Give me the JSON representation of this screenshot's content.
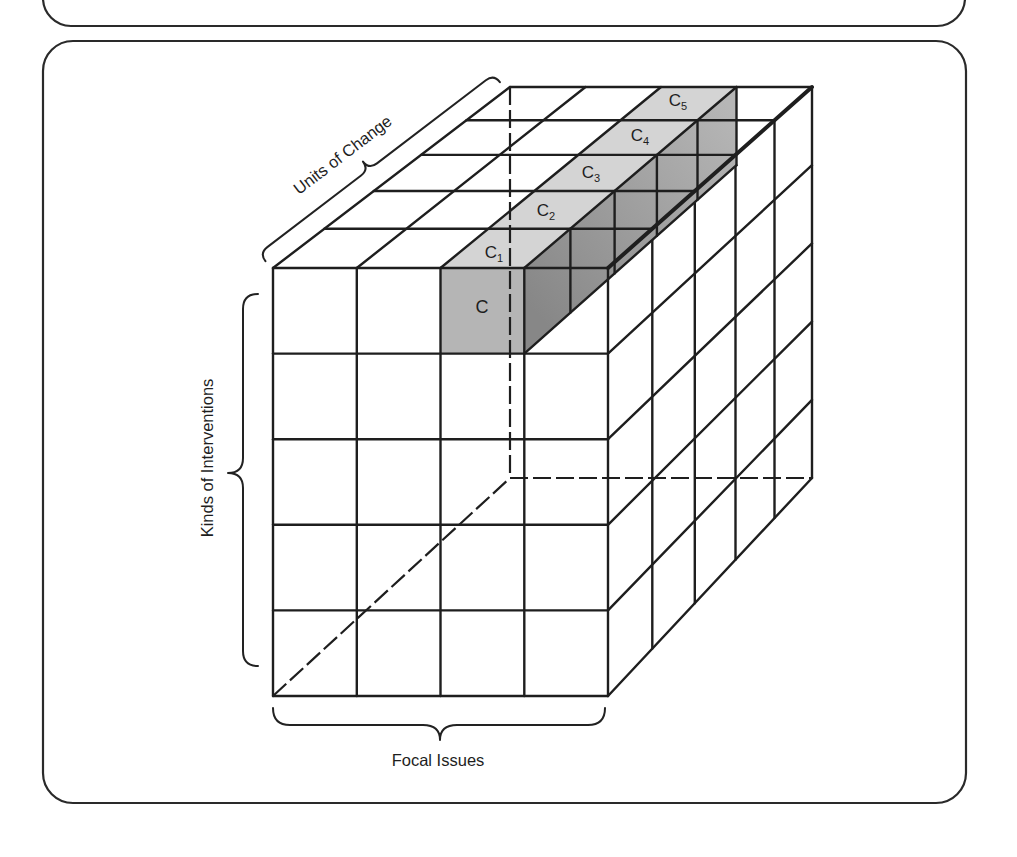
{
  "figure": {
    "axes": {
      "depth": {
        "label": "Units of Change",
        "count": 5
      },
      "vertical": {
        "label": "Kinds of Interventions",
        "count": 5
      },
      "horizontal": {
        "label": "Focal Issues",
        "count": 4
      }
    },
    "highlight": {
      "column_index": 2,
      "front_cell": {
        "base": "C",
        "sub": ""
      },
      "chain": [
        {
          "base": "C",
          "sub": "1"
        },
        {
          "base": "C",
          "sub": "2"
        },
        {
          "base": "C",
          "sub": "3"
        },
        {
          "base": "C",
          "sub": "4"
        },
        {
          "base": "C",
          "sub": "5"
        }
      ]
    },
    "colors": {
      "line": "#1e1e1e",
      "top_strip": "#d4d4d4",
      "front_cell": "#b5b5b5",
      "side_face_near": "#878787",
      "side_face_far": "#b6b6b6",
      "card_border": "#2a2a2a",
      "background": "#ffffff"
    }
  }
}
